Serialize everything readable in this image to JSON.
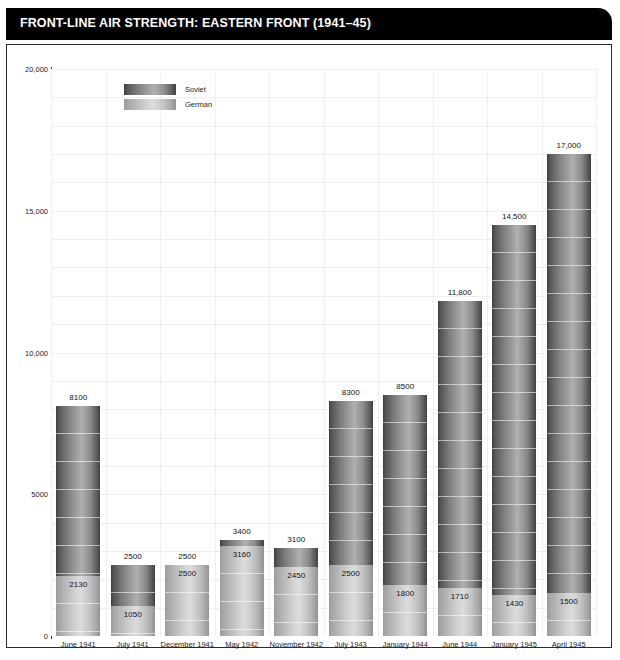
{
  "title": "FRONT-LINE AIR STRENGTH: EASTERN FRONT (1941–45)",
  "legend": {
    "position": "top-left",
    "entries": [
      {
        "label": "Soviet",
        "swatch": "soviet-gradient-swatch"
      },
      {
        "label": "German",
        "swatch": "german-gradient-swatch"
      }
    ]
  },
  "axes": {
    "y_ticks": [
      "0",
      "5000",
      "10,000",
      "15,000",
      "20,000"
    ],
    "y_tick_values": [
      0,
      5000,
      10000,
      15000,
      20000
    ],
    "ylim": [
      0,
      20000
    ]
  },
  "chart_data": {
    "type": "bar",
    "title": "FRONT-LINE AIR STRENGTH: EASTERN FRONT (1941–45)",
    "xlabel": "",
    "ylabel": "",
    "ylim": [
      0,
      20000
    ],
    "grid": true,
    "legend_position": "top-left",
    "categories": [
      "June 1941",
      "July 1941",
      "December 1941",
      "May 1942",
      "November 1942",
      "July 1943",
      "January 1944",
      "June 1944",
      "January 1945",
      "April 1945"
    ],
    "series": [
      {
        "name": "Soviet",
        "values": [
          8100,
          2500,
          2500,
          3400,
          3100,
          8300,
          8500,
          11800,
          14500,
          17000
        ],
        "labels": [
          "8100",
          "2500",
          "2500",
          "3400",
          "3100",
          "8300",
          "8500",
          "11,800",
          "14,500",
          "17,000"
        ]
      },
      {
        "name": "German",
        "values": [
          2130,
          1050,
          2500,
          3160,
          2450,
          2500,
          1800,
          1710,
          1430,
          1500
        ],
        "labels": [
          "2130",
          "1050",
          "2500",
          "3160",
          "2450",
          "2500",
          "1800",
          "1710",
          "1430",
          "1500"
        ]
      }
    ]
  }
}
